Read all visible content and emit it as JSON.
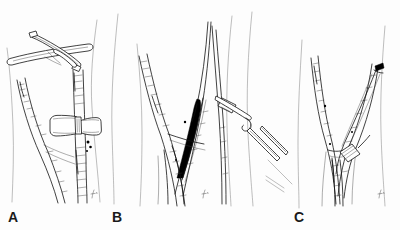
{
  "figure": {
    "kind": "surgical-line-drawing",
    "background_color": "#fdfdfd",
    "ink_color": "#111111",
    "width": 400,
    "height": 230
  },
  "panels": [
    {
      "id": "A",
      "label": "A",
      "label_x": 8,
      "label_y": 210,
      "caption_note": "Bifurcation exposed with a cross-bar retractor above and a bow-tie clamp across the vessel",
      "instruments": [
        {
          "name": "cross-bar-retractor",
          "shape": "crossed-rods"
        },
        {
          "name": "bowtie-clamp",
          "shape": "bowtie"
        }
      ],
      "markers": {
        "dots": 3
      }
    },
    {
      "id": "B",
      "label": "B",
      "label_x": 112,
      "label_y": 210,
      "caption_note": "Bifurcation with a solid dark graft segment in place and an angled clamp approaching from the right",
      "instruments": [
        {
          "name": "angled-forceps",
          "shape": "long-hooked-clamp"
        }
      ],
      "markers": {
        "graft_fill": "#000000"
      }
    },
    {
      "id": "C",
      "label": "C",
      "label_x": 294,
      "label_y": 210,
      "caption_note": "Completed repair showing the bifurcation with a small ligating clip and a dark marker clip at the upper right",
      "instruments": [
        {
          "name": "ligating-clip",
          "shape": "ladder-clip"
        }
      ],
      "markers": {
        "clip_marks": 2
      }
    }
  ],
  "signatures": [
    {
      "panel": "A",
      "x": 92,
      "y": 196
    },
    {
      "panel": "B",
      "x": 203,
      "y": 196
    },
    {
      "panel": "C",
      "x": 379,
      "y": 196
    }
  ]
}
